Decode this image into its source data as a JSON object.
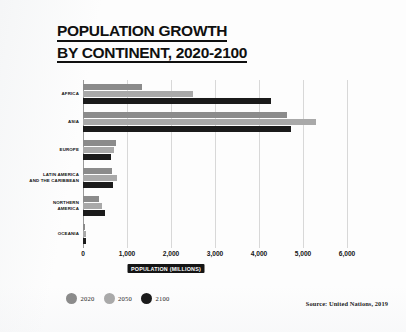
{
  "title": {
    "line1": "POPULATION GROWTH",
    "line2": "BY CONTINENT, 2020-2100"
  },
  "source": "Source: United Nations, 2019",
  "legend": {
    "items": [
      {
        "label": "2020",
        "color": "#8b8b8b"
      },
      {
        "label": "2050",
        "color": "#a9a9a9"
      },
      {
        "label": "2100",
        "color": "#1b1b1b"
      }
    ]
  },
  "chart_data": {
    "type": "bar",
    "orientation": "horizontal",
    "title": "POPULATION GROWTH BY CONTINENT, 2020-2100",
    "xlabel": "POPULATION (MILLIONS)",
    "ylabel": "",
    "xlim": [
      0,
      6000
    ],
    "xticks": [
      0,
      1000,
      2000,
      3000,
      4000,
      5000,
      6000
    ],
    "xtick_labels": [
      "0",
      "1,000",
      "2,000",
      "3,000",
      "4,000",
      "5,000",
      "6,000"
    ],
    "grid": true,
    "grid_axis": "x",
    "legend_position": "bottom-left",
    "categories": [
      "AFRICA",
      "ASIA",
      "EUROPE",
      "LATIN AMERICA AND THE CARIBBEAN",
      "NORTHERN AMERICA",
      "OCEANIA"
    ],
    "category_lines": [
      [
        "AFRICA"
      ],
      [
        "ASIA"
      ],
      [
        "EUROPE"
      ],
      [
        "LATIN AMERICA",
        "AND THE CARIBBEAN"
      ],
      [
        "NORTHERN",
        "AMERICA"
      ],
      [
        "OCEANIA"
      ]
    ],
    "series": [
      {
        "name": "2020",
        "color": "#8b8b8b",
        "values": [
          1341,
          4641,
          748,
          654,
          369,
          43
        ]
      },
      {
        "name": "2050",
        "color": "#a9a9a9",
        "values": [
          2489,
          5290,
          710,
          762,
          425,
          57
        ]
      },
      {
        "name": "2100",
        "color": "#1b1b1b",
        "values": [
          4280,
          4719,
          630,
          680,
          491,
          75
        ]
      }
    ]
  }
}
